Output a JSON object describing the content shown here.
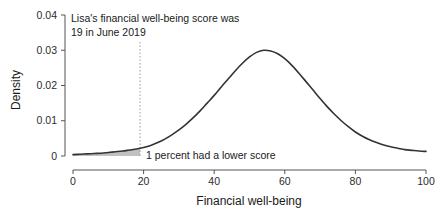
{
  "chart_data": {
    "type": "line",
    "title": "",
    "subtitle": "",
    "xlabel": "Financial well-being",
    "ylabel": "Density",
    "xlim": [
      0,
      100
    ],
    "ylim": [
      0,
      0.04
    ],
    "grid": false,
    "legend": null,
    "xticks": [
      0,
      20,
      40,
      60,
      80,
      100
    ],
    "xticklabels": [
      "0",
      "20",
      "40",
      "60",
      "80",
      "100"
    ],
    "yticks": [
      0,
      0.01,
      0.02,
      0.03,
      0.04
    ],
    "yticklabels": [
      "0",
      "0.01",
      "0.02",
      "0.03",
      "0.04"
    ],
    "series": [
      {
        "name": "Financial well-being density",
        "color": "#333333",
        "x": [
          0,
          2,
          4,
          6,
          8,
          10,
          12,
          14,
          16,
          18,
          19,
          20,
          22,
          24,
          26,
          28,
          30,
          32,
          34,
          36,
          38,
          40,
          42,
          44,
          46,
          48,
          50,
          52,
          54,
          56,
          58,
          60,
          62,
          64,
          66,
          68,
          70,
          72,
          74,
          76,
          78,
          80,
          82,
          84,
          86,
          88,
          90,
          92,
          94,
          96,
          98,
          100
        ],
        "y": [
          0.0004,
          0.0005,
          0.0006,
          0.0007,
          0.0008,
          0.001,
          0.0012,
          0.0014,
          0.0017,
          0.002,
          0.0022,
          0.0024,
          0.003,
          0.0038,
          0.0048,
          0.006,
          0.0074,
          0.009,
          0.0108,
          0.0128,
          0.015,
          0.0172,
          0.0196,
          0.0219,
          0.0242,
          0.0263,
          0.0281,
          0.0294,
          0.03,
          0.0298,
          0.029,
          0.0276,
          0.0257,
          0.0235,
          0.0211,
          0.0187,
          0.0163,
          0.014,
          0.0119,
          0.01,
          0.0083,
          0.0068,
          0.0056,
          0.0046,
          0.0038,
          0.0031,
          0.0026,
          0.0022,
          0.0018,
          0.0016,
          0.0014,
          0.0013
        ]
      }
    ],
    "annotations": [
      {
        "name": "score-marker",
        "type": "vline",
        "x": 19,
        "label_line1": "Lisa's financial well-being score was",
        "label_line2": "19 in June 2019",
        "color": "#9a9a9a",
        "style": "dotted"
      },
      {
        "name": "lower-score-region",
        "type": "shaded-area",
        "x_from": 0,
        "x_to": 19,
        "label": "1 percent had a lower score",
        "percent": 1,
        "color": "#b5b5b5"
      }
    ]
  },
  "axes": {
    "x_title": "Financial well-being",
    "y_title": "Density"
  }
}
